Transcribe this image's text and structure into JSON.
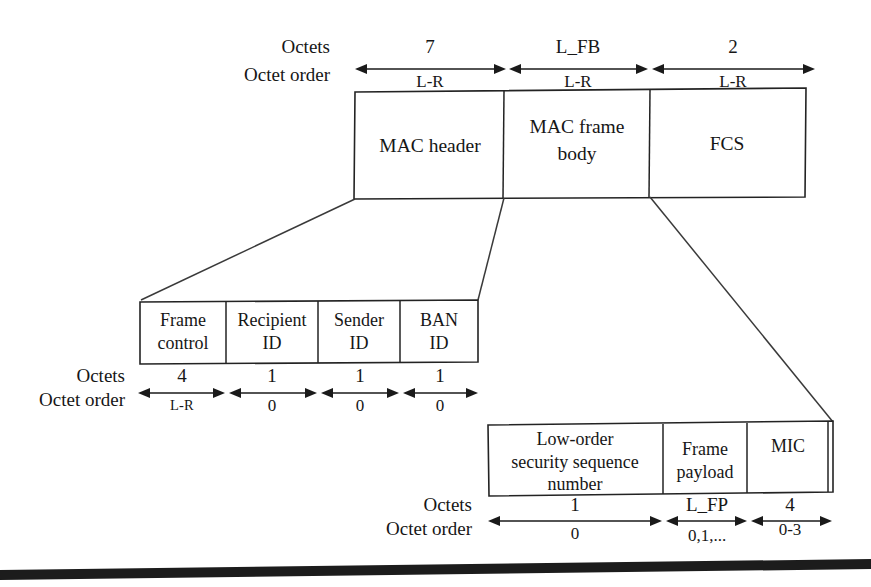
{
  "figure": {
    "row_labels": {
      "octets": "Octets",
      "octet_order": "Octet order"
    }
  },
  "colors": {
    "stroke": "#232323",
    "text": "#161616",
    "background": "#ffffff",
    "bottom_bar": "#1c1c1c"
  },
  "mac_frame": {
    "fields": [
      {
        "label_line1": "MAC header",
        "label_line2": "",
        "octets": "7",
        "octet_order": "L-R"
      },
      {
        "label_line1": "MAC frame",
        "label_line2": "body",
        "octets": "L_FB",
        "octet_order": "L-R"
      },
      {
        "label_line1": "FCS",
        "label_line2": "",
        "octets": "2",
        "octet_order": "L-R"
      }
    ]
  },
  "mac_header": {
    "fields": [
      {
        "label_line1": "Frame",
        "label_line2": "control",
        "octets": "4",
        "octet_order": "L-R"
      },
      {
        "label_line1": "Recipient",
        "label_line2": "ID",
        "octets": "1",
        "octet_order": "0"
      },
      {
        "label_line1": "Sender",
        "label_line2": "ID",
        "octets": "1",
        "octet_order": "0"
      },
      {
        "label_line1": "BAN",
        "label_line2": "ID",
        "octets": "1",
        "octet_order": "0"
      }
    ]
  },
  "mac_frame_body": {
    "fields": [
      {
        "label_line1": "Low-order",
        "label_line2": "security sequence",
        "label_line3": "number",
        "octets": "1",
        "octet_order": "0"
      },
      {
        "label_line1": "Frame",
        "label_line2": "payload",
        "label_line3": "",
        "octets": "L_FP",
        "octet_order": "0,1,..."
      },
      {
        "label_line1": "MIC",
        "label_line2": "",
        "label_line3": "",
        "octets": "4",
        "octet_order": "0-3"
      }
    ]
  }
}
